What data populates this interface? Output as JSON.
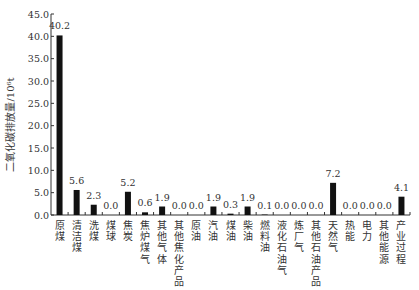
{
  "chart_data": {
    "type": "bar",
    "title": "",
    "xlabel": "",
    "ylabel": "二氧化碳排放量/10⁶t",
    "ylim": [
      0,
      45
    ],
    "yticks": [
      "0.0",
      "5.0",
      "10.0",
      "15.0",
      "20.0",
      "25.0",
      "30.0",
      "35.0",
      "40.0",
      "45.0"
    ],
    "grid": false,
    "legend": null,
    "bar_color": "#111111",
    "categories": [
      "原煤",
      "清洁煤",
      "洗煤",
      "煤球",
      "焦炭",
      "焦炉煤气",
      "其他气体",
      "其他焦化产品",
      "原油",
      "汽油",
      "煤油",
      "柴油",
      "燃料油",
      "液化石油气",
      "炼厂气",
      "其他石油产品",
      "天然气",
      "热能",
      "电力",
      "其他能源",
      "产业过程"
    ],
    "values": [
      40.2,
      5.6,
      2.3,
      0.0,
      5.2,
      0.6,
      1.9,
      0.0,
      0.0,
      1.9,
      0.3,
      1.9,
      0.1,
      0.0,
      0.0,
      0.0,
      7.2,
      0.0,
      0.0,
      0.0,
      4.1
    ],
    "value_labels": [
      "40.2",
      "5.6",
      "2.3",
      "0.0",
      "5.2",
      "0.6",
      "1.9",
      "0.0",
      "0.0",
      "1.9",
      "0.3",
      "1.9",
      "0.1",
      "0.0",
      "0.0",
      "0.0",
      "7.2",
      "0.0",
      "0.0",
      "0.0",
      "4.1"
    ]
  }
}
